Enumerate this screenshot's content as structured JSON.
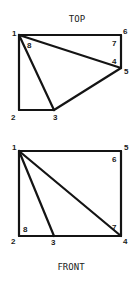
{
  "views": [
    {
      "name": "top",
      "title": "TOP",
      "title_pos": [
        77,
        22
      ],
      "vertices": {
        "1": [
          19,
          35
        ],
        "2": [
          19,
          110
        ],
        "3": [
          54,
          110
        ],
        "5": [
          121,
          68
        ],
        "6": [
          121,
          35
        ]
      },
      "edges": [
        [
          "1",
          "6"
        ],
        [
          "6",
          "5"
        ],
        [
          "5",
          "3"
        ],
        [
          "3",
          "2"
        ],
        [
          "2",
          "1"
        ],
        [
          "1",
          "3"
        ],
        [
          "1",
          "5"
        ]
      ],
      "labels": [
        {
          "text": "1",
          "x": 12,
          "y": 36
        },
        {
          "text": "8",
          "x": 27,
          "y": 48
        },
        {
          "text": "6",
          "x": 123,
          "y": 34
        },
        {
          "text": "7",
          "x": 112,
          "y": 46
        },
        {
          "text": "4",
          "x": 112,
          "y": 64
        },
        {
          "text": "5",
          "x": 124,
          "y": 74
        },
        {
          "text": "2",
          "x": 11,
          "y": 120
        },
        {
          "text": "3",
          "x": 53,
          "y": 120
        }
      ]
    },
    {
      "name": "front",
      "title": "FRONT",
      "title_pos": [
        71,
        270
      ],
      "vertices": {
        "1": [
          19,
          151
        ],
        "2": [
          19,
          236
        ],
        "3": [
          54,
          236
        ],
        "4": [
          121,
          236
        ],
        "5": [
          121,
          151
        ]
      },
      "edges": [
        [
          "1",
          "5"
        ],
        [
          "5",
          "4"
        ],
        [
          "4",
          "2"
        ],
        [
          "2",
          "1"
        ],
        [
          "1",
          "3"
        ],
        [
          "1",
          "4"
        ]
      ],
      "labels": [
        {
          "text": "1",
          "x": 12,
          "y": 150
        },
        {
          "text": "5",
          "x": 124,
          "y": 150
        },
        {
          "text": "6",
          "x": 112,
          "y": 162
        },
        {
          "text": "7",
          "x": 112,
          "y": 230
        },
        {
          "text": "8",
          "x": 23,
          "y": 232
        },
        {
          "text": "2",
          "x": 11,
          "y": 244
        },
        {
          "text": "3",
          "x": 51,
          "y": 245
        },
        {
          "text": "4",
          "x": 123,
          "y": 244
        }
      ]
    }
  ]
}
